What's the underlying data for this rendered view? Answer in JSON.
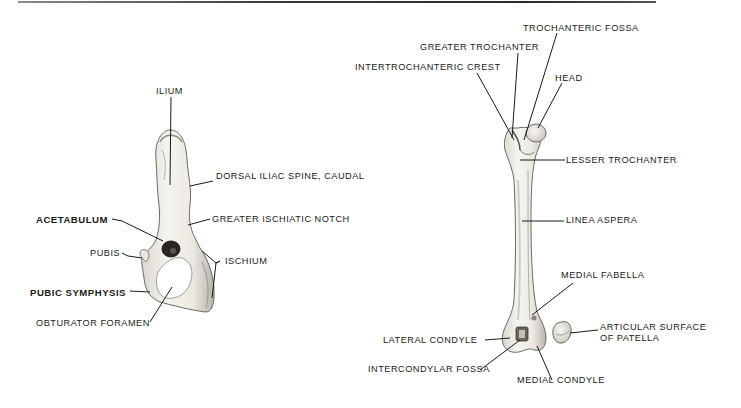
{
  "diagram": {
    "subjects": [
      "hip bone (os coxae)",
      "femur",
      "patella"
    ],
    "pelvis_labels": {
      "ilium": "ILIUM",
      "dorsal_iliac_spine": "DORSAL ILIAC SPINE, CAUDAL",
      "acetabulum": "ACETABULUM",
      "greater_ischiatic_notch": "GREATER ISCHIATIC NOTCH",
      "pubis": "PUBIS",
      "ischium": "ISCHIUM",
      "pubic_symphysis": "PUBIC SYMPHYSIS",
      "obturator_foramen": "OBTURATOR FORAMEN"
    },
    "femur_labels": {
      "trochanteric_fossa": "TROCHANTERIC FOSSA",
      "greater_trochanter": "GREATER TROCHANTER",
      "intertrochanteric_crest": "INTERTROCHANTERIC CREST",
      "head": "HEAD",
      "lesser_trochanter": "LESSER TROCHANTER",
      "linea_aspera": "LINEA ASPERA",
      "medial_fabella": "MEDIAL FABELLA",
      "lateral_condyle": "LATERAL CONDYLE",
      "intercondylar_fossa": "INTERCONDYLAR FOSSA",
      "medial_condyle": "MEDIAL CONDYLE"
    },
    "patella_labels": {
      "articular_surface_line1": "ARTICULAR SURFACE",
      "articular_surface_line2": "OF PATELLA"
    },
    "bold_labels": [
      "ACETABULUM",
      "PUBIC SYMPHYSIS"
    ],
    "colors": {
      "ink": "#1a1a1a",
      "bone_fill": "#f1efea",
      "bone_shade": "#c9c6bf",
      "background": "#ffffff"
    }
  }
}
